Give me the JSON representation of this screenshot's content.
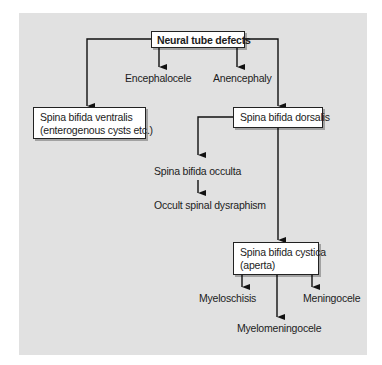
{
  "diagram": {
    "title": "Neural tube defects",
    "colors": {
      "panel_background": "#e1e1e1",
      "box_background": "#ffffff",
      "line": "#111111",
      "text": "#1c1c1c"
    },
    "nodes": {
      "root": {
        "label": "Neural tube defects",
        "style": "box-bold"
      },
      "encephalocele": {
        "label": "Encephalocele",
        "style": "text"
      },
      "anencephaly": {
        "label": "Anencephaly",
        "style": "text"
      },
      "ventralis": {
        "line1": "Spina bifida ventralis",
        "line2": "(enterogenous cysts etc.)",
        "style": "box"
      },
      "dorsalis": {
        "label": "Spina bifida dorsalis",
        "style": "box"
      },
      "occulta": {
        "label": "Spina bifida occulta",
        "style": "text"
      },
      "dysraphism": {
        "label": "Occult spinal dysraphism",
        "style": "text"
      },
      "cystica": {
        "line1": "Spina bifida cystica",
        "line2": "(aperta)",
        "style": "box"
      },
      "myeloschisis": {
        "label": "Myeloschisis",
        "style": "text"
      },
      "meningocele": {
        "label": "Meningocele",
        "style": "text"
      },
      "myelomeningocele": {
        "label": "Myelomeningocele",
        "style": "text"
      }
    },
    "edges": [
      [
        "Neural tube defects",
        "Spina bifida ventralis"
      ],
      [
        "Neural tube defects",
        "Encephalocele"
      ],
      [
        "Neural tube defects",
        "Anencephaly"
      ],
      [
        "Neural tube defects",
        "Spina bifida dorsalis"
      ],
      [
        "Spina bifida dorsalis",
        "Spina bifida occulta"
      ],
      [
        "Spina bifida occulta",
        "Occult spinal dysraphism"
      ],
      [
        "Spina bifida dorsalis",
        "Spina bifida cystica"
      ],
      [
        "Spina bifida cystica",
        "Myeloschisis"
      ],
      [
        "Spina bifida cystica",
        "Myelomeningocele"
      ],
      [
        "Spina bifida cystica",
        "Meningocele"
      ]
    ]
  }
}
